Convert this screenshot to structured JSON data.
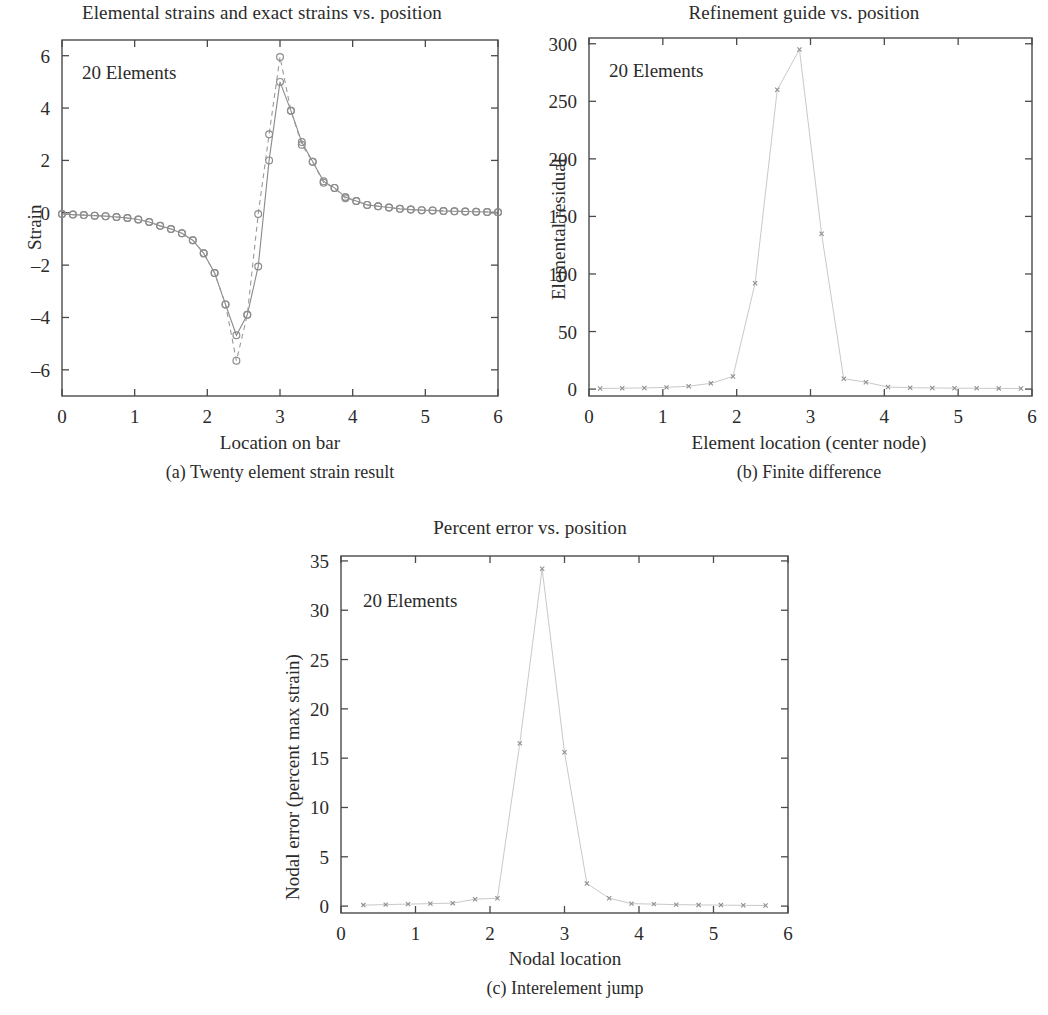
{
  "figure": {
    "background": "#ffffff",
    "axis_color": "#4a4a4a",
    "series_color": "#8a8a8a",
    "faint_color": "#c9c9c9"
  },
  "panel_a": {
    "title": "Elemental strains and exact strains vs. position",
    "caption": "(a) Twenty element strain result",
    "annotation": "20 Elements",
    "xlabel": "Location on bar",
    "ylabel": "Strain"
  },
  "panel_b": {
    "title": "Refinement guide vs. position",
    "caption": "(b) Finite difference",
    "annotation": "20 Elements",
    "xlabel": "Element location (center node)",
    "ylabel": "Elemental residual"
  },
  "panel_c": {
    "title": "Percent error vs. position",
    "caption": "(c) Interelement jump",
    "annotation": "20 Elements",
    "xlabel": "Nodal location",
    "ylabel": "Nodal error (percent max strain)"
  },
  "chart_data": [
    {
      "type": "line",
      "panel": "a",
      "title": "Elemental strains and exact strains vs. position",
      "xlabel": "Location on bar",
      "ylabel": "Strain",
      "xlim": [
        0,
        6
      ],
      "ylim": [
        -7,
        6.6
      ],
      "xticks": [
        0,
        1,
        2,
        3,
        4,
        5,
        6
      ],
      "xticklabels": [
        "0",
        "1",
        "2",
        "3",
        "4",
        "5",
        "6"
      ],
      "yticks": [
        -6,
        -4,
        -2,
        0,
        2,
        4,
        6
      ],
      "yticklabels": [
        "–6",
        "–4",
        "–2",
        "0",
        "2",
        "4",
        "6"
      ],
      "grid": false,
      "legend": null,
      "annotation": "20 Elements",
      "marker": "circle",
      "series": [
        {
          "name": "Elemental strains",
          "style": "solid",
          "x": [
            0.0,
            0.15,
            0.3,
            0.45,
            0.6,
            0.75,
            0.9,
            1.05,
            1.2,
            1.35,
            1.5,
            1.65,
            1.8,
            1.95,
            2.1,
            2.25,
            2.4,
            2.55,
            2.7,
            2.85,
            3.0,
            3.15,
            3.3,
            3.45,
            3.6,
            3.75,
            3.9,
            4.05,
            4.2,
            4.35,
            4.5,
            4.65,
            4.8,
            4.95,
            5.1,
            5.25,
            5.4,
            5.55,
            5.7,
            5.85,
            6.0
          ],
          "y": [
            -0.05,
            -0.07,
            -0.09,
            -0.11,
            -0.13,
            -0.16,
            -0.2,
            -0.26,
            -0.35,
            -0.5,
            -0.62,
            -0.78,
            -1.05,
            -1.55,
            -2.3,
            -3.5,
            -4.68,
            -3.9,
            -2.05,
            2.0,
            5.0,
            3.9,
            2.7,
            1.95,
            1.2,
            0.95,
            0.6,
            0.45,
            0.3,
            0.25,
            0.2,
            0.15,
            0.12,
            0.1,
            0.09,
            0.07,
            0.06,
            0.05,
            0.04,
            0.03,
            0.02
          ]
        },
        {
          "name": "Exact strains",
          "style": "dashed",
          "x": [
            0.0,
            0.15,
            0.3,
            0.45,
            0.6,
            0.75,
            0.9,
            1.05,
            1.2,
            1.35,
            1.5,
            1.65,
            1.8,
            1.95,
            2.1,
            2.25,
            2.4,
            2.55,
            2.7,
            2.85,
            3.0,
            3.15,
            3.3,
            3.45,
            3.6,
            3.75,
            3.9,
            4.05,
            4.2,
            4.35,
            4.5,
            4.65,
            4.8,
            4.95,
            5.1,
            5.25,
            5.4,
            5.55,
            5.7,
            5.85,
            6.0
          ],
          "y": [
            -0.05,
            -0.07,
            -0.09,
            -0.11,
            -0.13,
            -0.16,
            -0.2,
            -0.26,
            -0.35,
            -0.5,
            -0.62,
            -0.78,
            -1.05,
            -1.55,
            -2.3,
            -3.5,
            -5.65,
            -3.9,
            -0.05,
            3.0,
            5.95,
            3.9,
            2.6,
            1.95,
            1.15,
            0.95,
            0.55,
            0.45,
            0.3,
            0.25,
            0.2,
            0.15,
            0.12,
            0.1,
            0.09,
            0.07,
            0.06,
            0.05,
            0.04,
            0.03,
            0.02
          ]
        }
      ]
    },
    {
      "type": "line",
      "panel": "b",
      "title": "Refinement guide vs. position",
      "xlabel": "Element location (center node)",
      "ylabel": "Elemental residual",
      "xlim": [
        0,
        6
      ],
      "ylim": [
        -6,
        305
      ],
      "xticks": [
        0,
        1,
        2,
        3,
        4,
        5,
        6
      ],
      "xticklabels": [
        "0",
        "1",
        "2",
        "3",
        "4",
        "5",
        "6"
      ],
      "yticks": [
        0,
        50,
        100,
        150,
        200,
        250,
        300
      ],
      "yticklabels": [
        "0",
        "50",
        "100",
        "150",
        "200",
        "250",
        "300"
      ],
      "grid": false,
      "legend": null,
      "annotation": "20 Elements",
      "marker": "x",
      "series": [
        {
          "name": "Elemental residual",
          "style": "faint",
          "x": [
            0.15,
            0.45,
            0.75,
            1.05,
            1.35,
            1.65,
            1.95,
            2.25,
            2.55,
            2.85,
            3.15,
            3.45,
            3.75,
            4.05,
            4.35,
            4.65,
            4.95,
            5.25,
            5.55,
            5.85
          ],
          "y": [
            0.5,
            0.8,
            1.0,
            1.5,
            2.5,
            5.0,
            11.0,
            92.0,
            260.0,
            295.0,
            135.0,
            9.0,
            6.0,
            1.8,
            1.2,
            1.0,
            0.8,
            0.7,
            0.6,
            0.5
          ]
        }
      ]
    },
    {
      "type": "line",
      "panel": "c",
      "title": "Percent error vs. position",
      "xlabel": "Nodal location",
      "ylabel": "Nodal error (percent max strain)",
      "xlim": [
        0,
        6
      ],
      "ylim": [
        -0.7,
        35.5
      ],
      "xticks": [
        0,
        1,
        2,
        3,
        4,
        5,
        6
      ],
      "xticklabels": [
        "0",
        "1",
        "2",
        "3",
        "4",
        "5",
        "6"
      ],
      "yticks": [
        0,
        5,
        10,
        15,
        20,
        25,
        30,
        35
      ],
      "yticklabels": [
        "0",
        "5",
        "10",
        "15",
        "20",
        "25",
        "30",
        "35"
      ],
      "grid": false,
      "legend": null,
      "annotation": "20 Elements",
      "marker": "x",
      "series": [
        {
          "name": "Nodal error",
          "style": "faint",
          "x": [
            0.3,
            0.6,
            0.9,
            1.2,
            1.5,
            1.8,
            2.1,
            2.4,
            2.7,
            3.0,
            3.3,
            3.6,
            3.9,
            4.2,
            4.5,
            4.8,
            5.1,
            5.4,
            5.7
          ],
          "y": [
            0.1,
            0.15,
            0.2,
            0.25,
            0.3,
            0.7,
            0.8,
            16.5,
            34.2,
            15.6,
            2.3,
            0.8,
            0.25,
            0.2,
            0.15,
            0.12,
            0.1,
            0.08,
            0.06
          ]
        }
      ]
    }
  ]
}
